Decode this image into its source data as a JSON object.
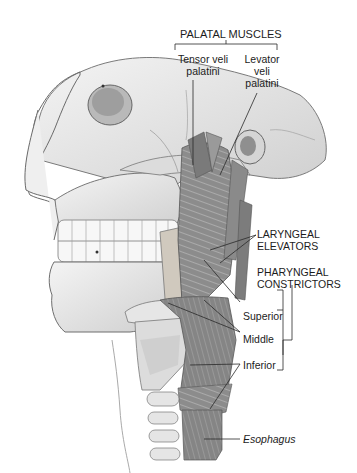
{
  "figure": {
    "colors": {
      "background": "#ffffff",
      "bone": "#e6e6e6",
      "muscle": "#8a8a8a",
      "text": "#1c1c1c",
      "leader_line": "#2a2a2a"
    }
  },
  "labels": {
    "palatal_muscles": {
      "heading": "PALATAL MUSCLES",
      "tensor_line1": "Tensor veli",
      "tensor_line2": "palatini",
      "levator_line1": "Levator",
      "levator_line2": "veli",
      "levator_line3": "palatini"
    },
    "laryngeal_elevators": {
      "line1": "LARYNGEAL",
      "line2": "ELEVATORS"
    },
    "pharyngeal_constrictors": {
      "line1": "PHARYNGEAL",
      "line2": "CONSTRICTORS",
      "superior": "Superior",
      "middle": "Middle",
      "inferior": "Inferior"
    },
    "esophagus": "Esophagus"
  }
}
